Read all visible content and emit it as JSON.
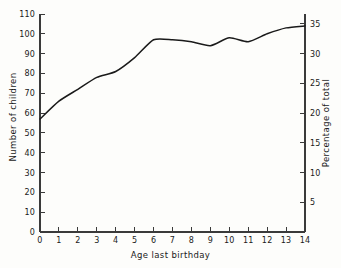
{
  "chart_data": {
    "type": "line",
    "title": "",
    "xlabel": "Age last birthday",
    "ylabel": "Number of children",
    "ylabel_right": "Percentage of total",
    "xlim": [
      0,
      14
    ],
    "ylim": [
      0,
      110
    ],
    "ylim_right": [
      0,
      36.666
    ],
    "grid": false,
    "legend": false,
    "x": [
      0,
      1,
      2,
      3,
      4,
      5,
      6,
      7,
      8,
      9,
      10,
      11,
      12,
      13,
      14
    ],
    "values": [
      57,
      66,
      72,
      78,
      81,
      88,
      97,
      97,
      96,
      94,
      98,
      96,
      100,
      103,
      104
    ],
    "series": [
      {
        "name": "Number of children",
        "values": [
          57,
          66,
          72,
          78,
          81,
          88,
          97,
          97,
          96,
          94,
          98,
          96,
          100,
          103,
          104
        ]
      }
    ],
    "xticks": [
      "0",
      "1",
      "2",
      "3",
      "4",
      "5",
      "6",
      "7",
      "8",
      "9",
      "10",
      "11",
      "12",
      "13",
      "14"
    ],
    "yticks_left": [
      "0",
      "10",
      "20",
      "30",
      "40",
      "50",
      "60",
      "70",
      "80",
      "90",
      "100",
      "110"
    ],
    "yticks_right": [
      "5",
      "10",
      "15",
      "20",
      "25",
      "30",
      "35"
    ],
    "ytick_values_left": [
      0,
      10,
      20,
      30,
      40,
      50,
      60,
      70,
      80,
      90,
      100,
      110
    ],
    "ytick_values_right": [
      5,
      10,
      15,
      20,
      25,
      30,
      35
    ],
    "line_color": "#1a1a1a",
    "axis_color": "#3a3a3a",
    "background_color": "#fdfdfb"
  }
}
